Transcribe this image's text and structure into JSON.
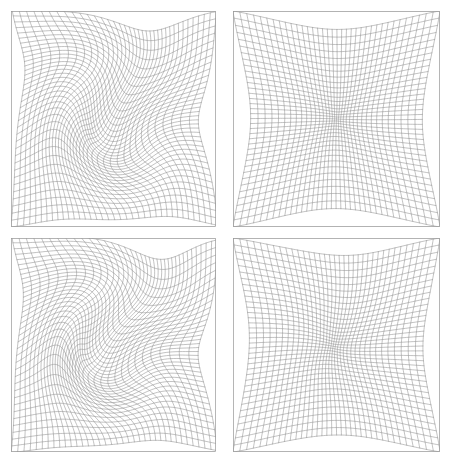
{
  "figure": {
    "title": "",
    "background": "#ffffff",
    "width": 449,
    "height": 463,
    "layout": {
      "rows": 2,
      "cols": 2
    }
  },
  "style": {
    "line_color": "#8a8a8a",
    "border_color": "#9a9a9a",
    "line_width": 0.55,
    "border_width": 0.7
  },
  "chart_data": {
    "type": "line",
    "title": "",
    "subtitle": "",
    "xlabel": "",
    "ylabel": "",
    "grid": true,
    "legend": null,
    "panels": [
      {
        "id": "panel-top-left",
        "position": {
          "row": 0,
          "col": 0
        },
        "bbox": {
          "x": 11,
          "y": 11,
          "w": 205,
          "h": 216
        },
        "distortion": "swirl",
        "grid": {
          "nx": 36,
          "ny": 36
        },
        "domain": {
          "xlim": [
            -1,
            1
          ],
          "ylim": [
            -1,
            1
          ]
        },
        "vortices": [
          {
            "cx": -0.07,
            "cy": -0.2,
            "strength": 1.55,
            "radius": 0.78
          },
          {
            "cx": 0.22,
            "cy": 0.3,
            "strength": -1.35,
            "radius": 0.72
          }
        ],
        "radial_pull": 0.46,
        "twist": 1.45
      },
      {
        "id": "panel-top-right",
        "position": {
          "row": 0,
          "col": 1
        },
        "bbox": {
          "x": 233,
          "y": 11,
          "w": 207,
          "h": 216
        },
        "distortion": "radial-pincushion",
        "grid": {
          "nx": 36,
          "ny": 36
        },
        "domain": {
          "xlim": [
            -1,
            1
          ],
          "ylim": [
            -1,
            1
          ]
        },
        "vortices": [
          {
            "cx": 0.02,
            "cy": -0.16,
            "strength": 0.0,
            "radius": 0.7
          },
          {
            "cx": 0.02,
            "cy": 0.22,
            "strength": 0.0,
            "radius": 0.7
          }
        ],
        "radial_pull": 0.7,
        "twist": 0.1
      },
      {
        "id": "panel-bottom-left",
        "position": {
          "row": 1,
          "col": 0
        },
        "bbox": {
          "x": 11,
          "y": 238,
          "w": 205,
          "h": 214
        },
        "distortion": "swirl-strong",
        "grid": {
          "nx": 36,
          "ny": 36
        },
        "domain": {
          "xlim": [
            -1,
            1
          ],
          "ylim": [
            -1,
            1
          ]
        },
        "vortices": [
          {
            "cx": 0.04,
            "cy": -0.22,
            "strength": 1.85,
            "radius": 0.8
          },
          {
            "cx": 0.1,
            "cy": 0.28,
            "strength": -1.6,
            "radius": 0.75
          }
        ],
        "radial_pull": 0.42,
        "twist": 1.85
      },
      {
        "id": "panel-bottom-right",
        "position": {
          "row": 1,
          "col": 1
        },
        "bbox": {
          "x": 233,
          "y": 238,
          "w": 207,
          "h": 214
        },
        "distortion": "radial-pincushion",
        "grid": {
          "nx": 36,
          "ny": 36
        },
        "domain": {
          "xlim": [
            -1,
            1
          ],
          "ylim": [
            -1,
            1
          ]
        },
        "vortices": [
          {
            "cx": -0.04,
            "cy": -0.12,
            "strength": 0.22,
            "radius": 0.72
          },
          {
            "cx": 0.06,
            "cy": 0.2,
            "strength": -0.2,
            "radius": 0.72
          }
        ],
        "radial_pull": 0.66,
        "twist": 0.3
      }
    ]
  }
}
